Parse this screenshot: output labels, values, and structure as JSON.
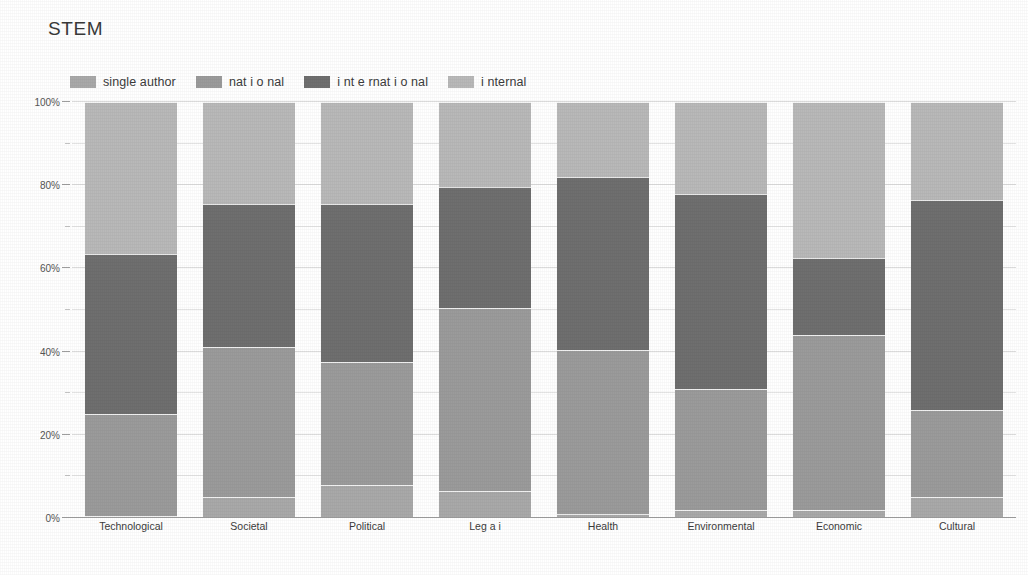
{
  "title": "STEM",
  "colors": {
    "single_author": "#a9a9a9",
    "national": "#9b9b9b",
    "international": "#6f6f6f",
    "internal": "#b9b9b9",
    "gridline": "#e4e4e4",
    "axis": "#9e9e9e",
    "text": "#3c3c3c"
  },
  "legend": {
    "items": [
      {
        "label": "single author",
        "color_key": "single_author"
      },
      {
        "label": "nat i o nal",
        "color_key": "national"
      },
      {
        "label": "i nt e rnat i o nal",
        "color_key": "international"
      },
      {
        "label": "i nternal",
        "color_key": "internal"
      }
    ]
  },
  "axis": {
    "y_ticks": [
      "0%",
      "20%",
      "40%",
      "60%",
      "80%",
      "100%"
    ],
    "y_tick_values": [
      0,
      20,
      40,
      60,
      80,
      100
    ],
    "y_minor_values": [
      10,
      30,
      50,
      70,
      90
    ]
  },
  "chart_data": {
    "type": "bar",
    "title": "STEM",
    "xlabel": "",
    "ylabel": "",
    "ylim": [
      0,
      100
    ],
    "stacked": true,
    "stack_mode": "percent",
    "grid": true,
    "legend_position": "top-left",
    "categories": [
      "Technological",
      "Societal",
      "Political",
      "Leg a i",
      "Health",
      "Environmental",
      "Economic",
      "Cultural"
    ],
    "series": [
      {
        "name": "single author",
        "color": "#a9a9a9",
        "values": [
          0.5,
          5.0,
          8.0,
          6.5,
          1.0,
          2.0,
          2.0,
          5.0
        ]
      },
      {
        "name": "nat i o nal",
        "color": "#9b9b9b",
        "values": [
          24.5,
          36.0,
          29.5,
          44.0,
          39.5,
          29.0,
          42.0,
          21.0
        ]
      },
      {
        "name": "i nt e rnat i o nal",
        "color": "#6f6f6f",
        "values": [
          38.5,
          34.5,
          38.0,
          29.0,
          41.5,
          47.0,
          18.5,
          50.5
        ]
      },
      {
        "name": "i nternal",
        "color": "#b9b9b9",
        "values": [
          36.5,
          24.5,
          24.5,
          20.5,
          18.0,
          22.0,
          37.5,
          23.5
        ]
      }
    ],
    "cumulative_tops": {
      "single author": [
        0.5,
        5.0,
        8.0,
        6.5,
        1.0,
        2.0,
        2.0,
        5.0
      ],
      "nat i o nal": [
        25.0,
        41.0,
        37.5,
        50.5,
        40.5,
        31.0,
        44.0,
        26.0
      ],
      "i nt e rnat i o nal": [
        63.5,
        75.5,
        75.5,
        79.5,
        82.0,
        78.0,
        62.5,
        76.5
      ],
      "i nternal": [
        100,
        100,
        100,
        100,
        100,
        100,
        100,
        100
      ]
    }
  }
}
